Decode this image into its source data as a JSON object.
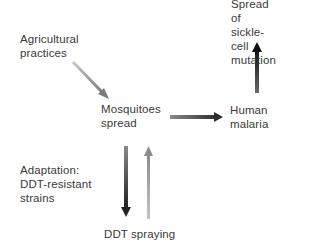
{
  "diagram": {
    "nodes": {
      "agricultural": {
        "text": "Agricultural\npractices"
      },
      "mosquitoes": {
        "text": "Mosquitoes\nspread"
      },
      "malaria": {
        "text": "Human\nmalaria"
      },
      "sickle": {
        "text": "Spread of\nsickle-cell\nmutation"
      },
      "adaptation": {
        "text": "Adaptation:\nDDT-resistant\nstrains"
      },
      "ddt": {
        "text": "DDT spraying"
      }
    },
    "edges": [
      {
        "from": "Agricultural practices",
        "to": "Mosquitoes spread",
        "color": "#8a8a8a"
      },
      {
        "from": "Mosquitoes spread",
        "to": "Human malaria",
        "color": "#3a3a3a"
      },
      {
        "from": "Human malaria",
        "to": "Spread of sickle-cell mutation",
        "color": "#1e1e1e"
      },
      {
        "from": "Mosquitoes spread",
        "to": "DDT spraying",
        "color": "#3a3a3a"
      },
      {
        "from": "DDT spraying",
        "to": "Mosquitoes spread",
        "color": "#9a9a9a"
      }
    ]
  }
}
